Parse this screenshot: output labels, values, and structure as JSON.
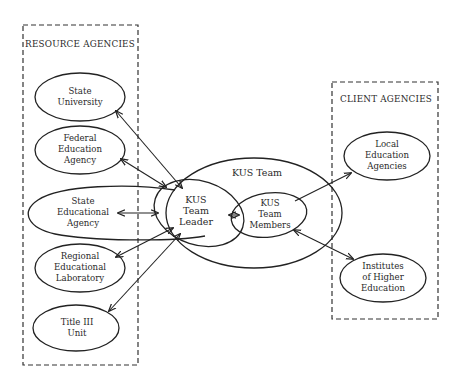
{
  "diagram": {
    "groups": {
      "resource": {
        "title": "RESOURCE AGENCIES"
      },
      "client": {
        "title": "CLIENT AGENCIES"
      }
    },
    "nodes": {
      "state_university": {
        "line1": "State",
        "line2": "University"
      },
      "federal_education_agency": {
        "line1": "Federal",
        "line2": "Education",
        "line3": "Agency"
      },
      "state_educational_agency": {
        "line1": "State",
        "line2": "Educational",
        "line3": "Agency"
      },
      "regional_educational_laboratory": {
        "line1": "Regional",
        "line2": "Educational",
        "line3": "Laboratory"
      },
      "title_iii_unit": {
        "line1": "Title III",
        "line2": "Unit"
      },
      "kus_team": {
        "label": "KUS Team"
      },
      "kus_team_leader": {
        "line1": "KUS",
        "line2": "Team",
        "line3": "Leader"
      },
      "kus_team_members": {
        "line1": "KUS",
        "line2": "Team",
        "line3": "Members"
      },
      "local_education_agencies": {
        "line1": "Local",
        "line2": "Education",
        "line3": "Agencies"
      },
      "institutes_higher_education": {
        "line1": "Institutes",
        "line2": "of Higher",
        "line3": "Education"
      }
    },
    "edges": [
      {
        "from": "KUS Team Leader",
        "to": "State University",
        "direction": "both"
      },
      {
        "from": "KUS Team Leader",
        "to": "Federal Education Agency",
        "direction": "both"
      },
      {
        "from": "KUS Team Leader",
        "to": "State Educational Agency",
        "direction": "both"
      },
      {
        "from": "KUS Team Leader",
        "to": "Regional Educational Laboratory",
        "direction": "both"
      },
      {
        "from": "KUS Team Leader",
        "to": "Title III Unit",
        "direction": "both"
      },
      {
        "from": "KUS Team Leader",
        "to": "KUS Team Members",
        "direction": "both"
      },
      {
        "from": "KUS Team Members",
        "to": "Local Education Agencies",
        "direction": "forward"
      },
      {
        "from": "KUS Team Members",
        "to": "Institutes of Higher Education",
        "direction": "both"
      }
    ]
  }
}
